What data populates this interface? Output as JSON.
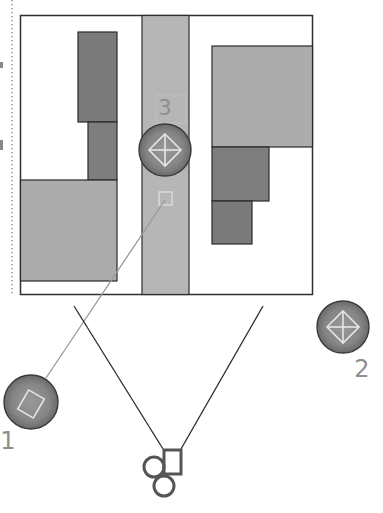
{
  "diagram": {
    "colors": {
      "frame": "#2e2e2e",
      "road": "#b6b6b6",
      "building_light": "#acacac",
      "building_dark": "#7a7a7a",
      "camera_fill": "#8a8a8a",
      "camera_edge": "#3a3a3a",
      "icon_stroke": "#e6e6e6",
      "label": "#8e8e8e",
      "sight_line": "#999999",
      "cone_line": "#2a2a2a"
    },
    "cameras": [
      {
        "id": "camera-1",
        "label": "1",
        "icon": "rectangle-icon"
      },
      {
        "id": "camera-2",
        "label": "2",
        "icon": "diamond-crosshair-icon"
      },
      {
        "id": "camera-3",
        "label": "3",
        "icon": "diamond-crosshair-icon"
      }
    ],
    "viewer": {
      "icon": "camera-viewer-icon"
    },
    "edge_marks": [
      "",
      ""
    ]
  }
}
